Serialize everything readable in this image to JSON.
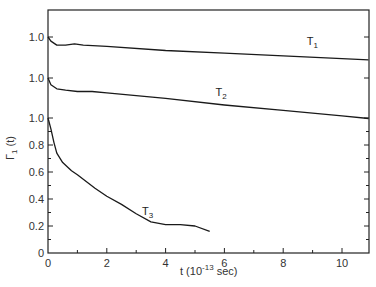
{
  "chart_data": {
    "type": "line",
    "title": "",
    "xlabel": "t (10^-13 sec)",
    "xlabel_main": "t (10",
    "xlabel_exp": "-13",
    "xlabel_tail": " sec)",
    "ylabel": "Γ1 (t)",
    "ylabel_main": "Γ",
    "ylabel_sub": "1",
    "ylabel_tail": " (t)",
    "xlim": [
      0,
      10.9
    ],
    "ylim": [
      0,
      1.0
    ],
    "x_ticks": [
      "0",
      "2",
      "4",
      "6",
      "8",
      "10"
    ],
    "y_ticks": [
      "0",
      "0.2",
      "0.4",
      "0.6",
      "0.8",
      "1.0"
    ],
    "offset_y_labels": [
      "1.0",
      "1.0"
    ],
    "grid": false,
    "legend": "inline curve labels",
    "series": [
      {
        "name": "T1",
        "label_main": "T",
        "label_sub": "1",
        "note": "vertically offset curve, starts at 1.0",
        "x": [
          0,
          0.1,
          0.3,
          0.6,
          0.9,
          1.2,
          2,
          4,
          6,
          8,
          10,
          10.9
        ],
        "values": [
          1.0,
          0.97,
          0.94,
          0.94,
          0.95,
          0.94,
          0.93,
          0.9,
          0.88,
          0.86,
          0.84,
          0.83
        ]
      },
      {
        "name": "T2",
        "label_main": "T",
        "label_sub": "2",
        "note": "vertically offset curve, starts at 1.0",
        "x": [
          0,
          0.1,
          0.3,
          0.6,
          1.0,
          1.5,
          2,
          4,
          6,
          8,
          10,
          10.9
        ],
        "values": [
          1.0,
          0.95,
          0.92,
          0.91,
          0.9,
          0.9,
          0.89,
          0.85,
          0.8,
          0.76,
          0.72,
          0.7
        ]
      },
      {
        "name": "T3",
        "label_main": "T",
        "label_sub": "3",
        "x": [
          0,
          0.1,
          0.2,
          0.3,
          0.5,
          0.8,
          1.0,
          1.3,
          1.6,
          2.0,
          2.5,
          3.0,
          3.5,
          4.0,
          4.5,
          5.0,
          5.5
        ],
        "values": [
          1.0,
          0.92,
          0.82,
          0.74,
          0.67,
          0.61,
          0.58,
          0.53,
          0.48,
          0.42,
          0.36,
          0.29,
          0.23,
          0.21,
          0.21,
          0.2,
          0.16
        ]
      }
    ]
  }
}
